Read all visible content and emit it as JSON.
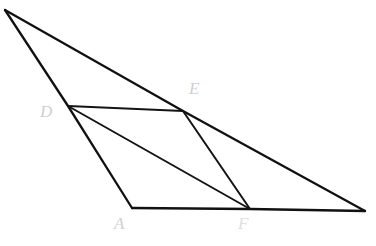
{
  "figure": {
    "canvas": {
      "width": 376,
      "height": 246,
      "background": "#ffffff"
    },
    "stroke_color": "#111111",
    "label_color": "#cfcfcf",
    "points": {
      "B": {
        "x": 5,
        "y": 10,
        "label": ""
      },
      "D": {
        "x": 68,
        "y": 106,
        "label": "D"
      },
      "A": {
        "x": 132,
        "y": 208,
        "label": "A"
      },
      "E": {
        "x": 183,
        "y": 111,
        "label": "E"
      },
      "F": {
        "x": 250,
        "y": 209,
        "label": "F"
      },
      "C": {
        "x": 365,
        "y": 211,
        "label": ""
      }
    },
    "labels": [
      {
        "id": "label-A",
        "text": "A",
        "x": 114,
        "y": 215
      },
      {
        "id": "label-D",
        "text": "D",
        "x": 40,
        "y": 103
      },
      {
        "id": "label-E",
        "text": "E",
        "x": 189,
        "y": 80
      },
      {
        "id": "label-F",
        "text": "F",
        "x": 238,
        "y": 215
      }
    ],
    "segments": [
      {
        "id": "seg-B-A",
        "name": "side-B-through-D-to-A",
        "from": "B",
        "to": "A",
        "path": "M 5 10 L 68 106 L 132 208"
      },
      {
        "id": "seg-B-C",
        "name": "side-B-through-E-to-C",
        "from": "B",
        "to": "C",
        "path": "M 5 10 L 183 111 L 365 211"
      },
      {
        "id": "seg-A-C",
        "name": "base-A-through-F-to-C",
        "from": "A",
        "to": "C",
        "path": "M 132 208 L 250 209 L 365 211"
      },
      {
        "id": "seg-D-E",
        "name": "segment-D-E",
        "from": "D",
        "to": "E",
        "path": "M 68 106 L 183 111"
      },
      {
        "id": "seg-E-F",
        "name": "segment-E-F",
        "from": "E",
        "to": "F",
        "path": "M 183 111 L 250 209"
      },
      {
        "id": "seg-D-F",
        "name": "diagonal-D-F",
        "from": "D",
        "to": "F",
        "path": "M 68 106 L 250 209"
      }
    ]
  }
}
